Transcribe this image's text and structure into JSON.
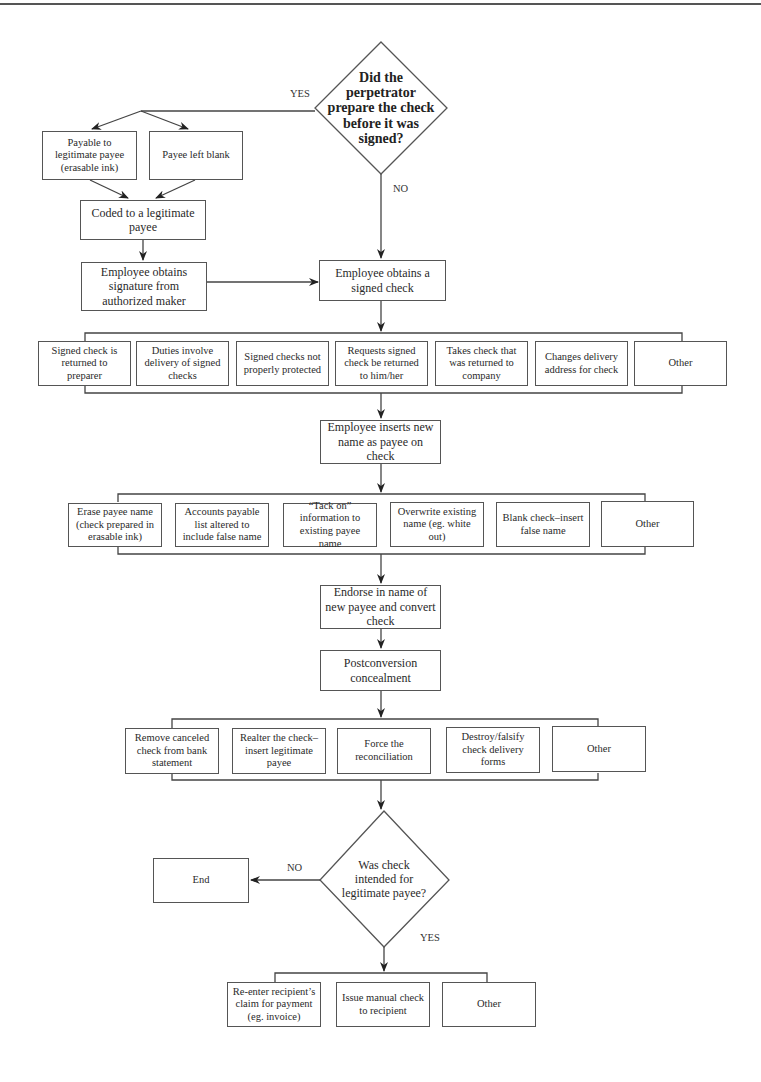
{
  "decision_1": {
    "text": "Did the perpetrator prepare the check before it was signed?",
    "yes_label": "YES",
    "no_label": "NO"
  },
  "yes_branch": {
    "options": [
      "Payable to legitimate payee (erasable ink)",
      "Payee left blank"
    ],
    "coded": "Coded to a legitimate payee",
    "signature": "Employee obtains signature from authorized maker"
  },
  "obtains_signed_check": "Employee obtains a signed check",
  "how_obtained": [
    "Signed check is returned to preparer",
    "Duties involve delivery of signed checks",
    "Signed checks not properly protected",
    "Requests signed check be returned to him/her",
    "Takes check that was returned to company",
    "Changes delivery address for check",
    "Other"
  ],
  "inserts_name": "Employee inserts new name as payee on check",
  "alteration_methods": [
    "Erase payee name (check prepared in erasable ink)",
    "Accounts payable list altered to include false name",
    "“Tack on” information to existing payee name",
    "Overwrite existing name (eg. white out)",
    "Blank check–insert false name",
    "Other"
  ],
  "endorse": "Endorse in name of new payee and convert check",
  "postconversion": "Postconversion concealment",
  "concealment_methods": [
    "Remove canceled check from bank statement",
    "Realter the check–insert legitimate payee",
    "Force the reconciliation",
    "Destroy/falsify check delivery forms",
    "Other"
  ],
  "decision_2": {
    "text": "Was check intended for legitimate payee?",
    "no_label": "NO",
    "yes_label": "YES"
  },
  "end": "End",
  "final_actions": [
    "Re-enter recipient’s claim for payment (eg. invoice)",
    "Issue manual check to recipient",
    "Other"
  ]
}
